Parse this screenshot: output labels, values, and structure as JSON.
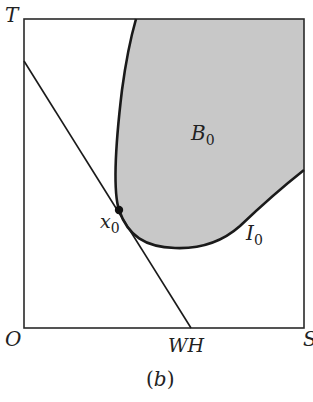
{
  "figure": {
    "caption": "(b)",
    "caption_letter": "b",
    "colors": {
      "background": "#ffffff",
      "frame": "#2a2a2a",
      "region_fill": "#c8c8c8",
      "curve": "#1a1a1a",
      "point": "#111111"
    },
    "axes": {
      "origin_label": "O",
      "y_axis_label": "T",
      "x_axis_end_label": "S",
      "x_intercept_label": "WH"
    },
    "region": {
      "label": "B",
      "subscript": "0"
    },
    "curve": {
      "label": "I",
      "subscript": "0"
    },
    "point": {
      "label": "x",
      "subscript": "0"
    }
  }
}
